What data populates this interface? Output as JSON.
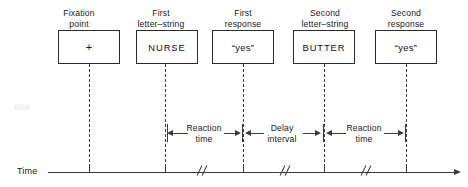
{
  "figure": {
    "type": "timeline-diagram"
  },
  "events": [
    {
      "label": "Fixation\npoint",
      "content": "+",
      "name": "fixation-point"
    },
    {
      "label": "First\nletter–string",
      "content": "NURSE",
      "name": "first-letter-string"
    },
    {
      "label": "First\nresponse",
      "content": "“yes”",
      "name": "first-response"
    },
    {
      "label": "Second\nletter–string",
      "content": "BUTTER",
      "name": "second-letter-string"
    },
    {
      "label": "Second\nresponse",
      "content": "“yes”",
      "name": "second-response"
    }
  ],
  "intervals": [
    {
      "label": "Reaction\ntime",
      "name": "reaction-time-1"
    },
    {
      "label": "Delay\ninterval",
      "name": "delay-interval"
    },
    {
      "label": "Reaction\ntime",
      "name": "reaction-time-2"
    }
  ],
  "axis": {
    "label": "Time",
    "direction": "left-to-right",
    "breaks": 3
  },
  "colors": {
    "ink": "#2b2b2b",
    "background": "#ffffff"
  }
}
